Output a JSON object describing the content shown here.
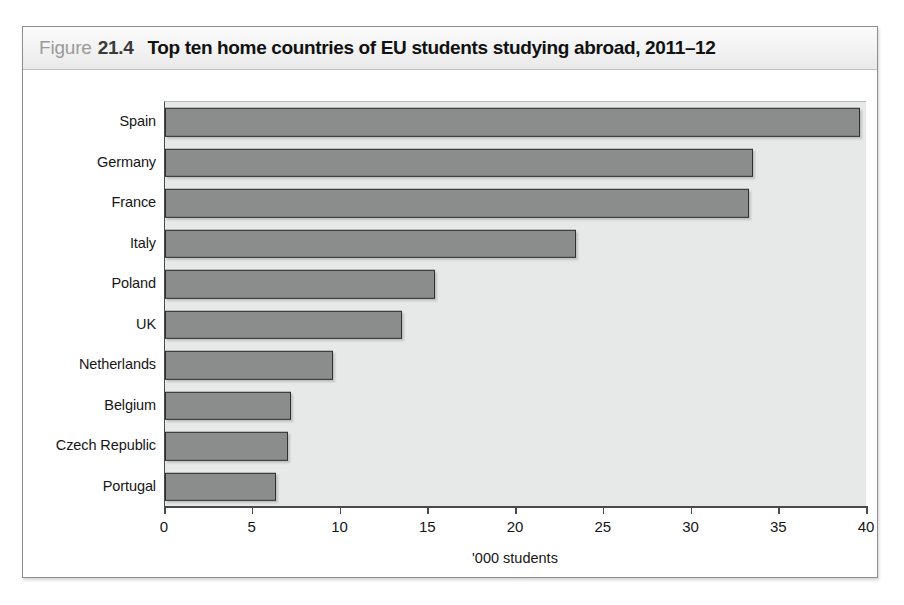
{
  "figure": {
    "label_word": "Figure",
    "number": "21.4",
    "title": "Top ten home countries of EU students studying abroad, 2011–12"
  },
  "chart_data": {
    "type": "bar",
    "orientation": "horizontal",
    "title": "Top ten home countries of EU students studying abroad, 2011–12",
    "categories": [
      "Spain",
      "Germany",
      "France",
      "Italy",
      "Poland",
      "UK",
      "Netherlands",
      "Belgium",
      "Czech Republic",
      "Portugal"
    ],
    "values": [
      39.6,
      33.5,
      33.3,
      23.4,
      15.4,
      13.5,
      9.6,
      7.2,
      7.0,
      6.3
    ],
    "series": [
      {
        "name": "EU students studying abroad",
        "values": [
          39.6,
          33.5,
          33.3,
          23.4,
          15.4,
          13.5,
          9.6,
          7.2,
          7.0,
          6.3
        ]
      }
    ],
    "xlabel": "'000 students",
    "ylabel": "",
    "xlim": [
      0,
      40
    ],
    "xticks": [
      0,
      5,
      10,
      15,
      20,
      25,
      30,
      35,
      40
    ],
    "xtick_labels": [
      "0",
      "5",
      "10",
      "15",
      "20",
      "25",
      "30",
      "35",
      "40"
    ],
    "grid": false,
    "legend": false,
    "bar_color": "#8b8c8c",
    "bar_border_color": "#2f2f2f",
    "plot_background": "#e7e8e8"
  }
}
